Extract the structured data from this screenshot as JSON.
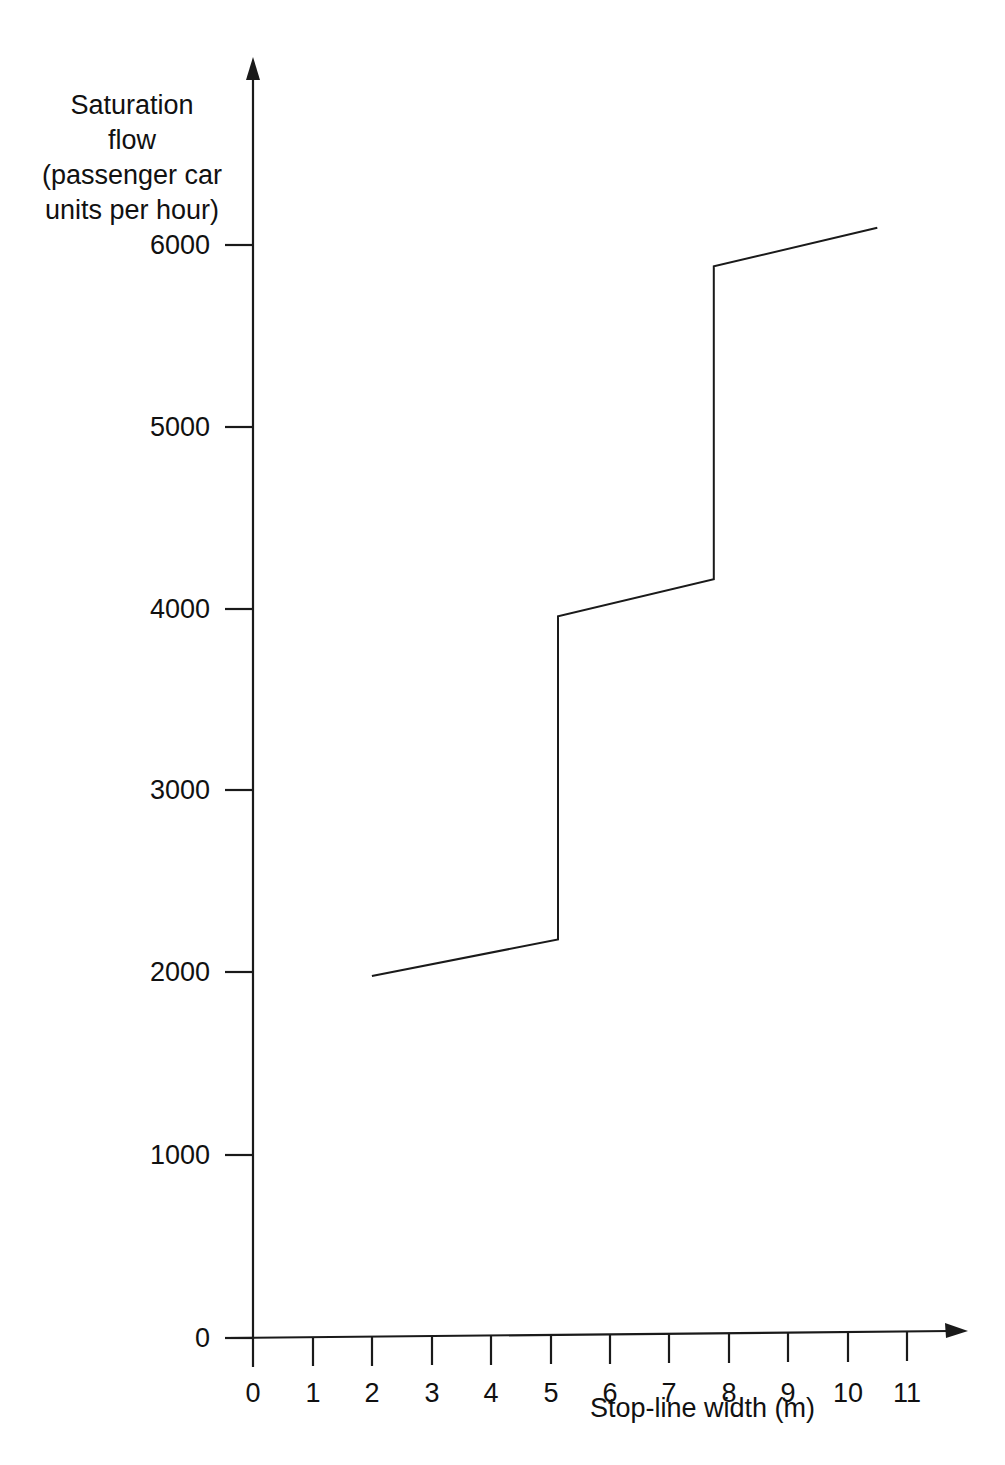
{
  "chart_data": {
    "type": "line",
    "title": "",
    "xlabel": "Stop-line width (m)",
    "ylabel": "Saturation flow\n(passenger car\nunits per hour)",
    "xlim": [
      0,
      11.8
    ],
    "ylim": [
      0,
      6400
    ],
    "xticks": [
      0,
      1,
      2,
      3,
      4,
      5,
      6,
      7,
      8,
      9,
      10,
      11
    ],
    "xtick_labels": [
      "0",
      "1",
      "2",
      "3",
      "4",
      "5",
      "6",
      "7",
      "8",
      "9",
      "10",
      "11"
    ],
    "yticks": [
      0,
      1000,
      2000,
      3000,
      4000,
      5000,
      6000
    ],
    "ytick_labels": [
      "0",
      "1000",
      "2000",
      "3000",
      "4000",
      "5000",
      "6000"
    ],
    "grid": false,
    "legend": null,
    "line_color": "#1a1a1a",
    "axis_color": "#1a1a1a",
    "series": [
      {
        "name": "Saturation flow",
        "step_like": true,
        "points": [
          {
            "x": 2.0,
            "y": 1980
          },
          {
            "x": 5.13,
            "y": 2170
          },
          {
            "x": 5.13,
            "y": 3945
          },
          {
            "x": 7.75,
            "y": 4140
          },
          {
            "x": 7.75,
            "y": 5857
          },
          {
            "x": 10.5,
            "y": 6060
          }
        ]
      }
    ],
    "annotations": []
  },
  "axes": {
    "y_title_line_1": "Saturation",
    "y_title_line_2": "flow",
    "y_title_line_3": "(passenger car",
    "y_title_line_4": "units per hour)",
    "x_title": "Stop-line width (m)"
  },
  "ytick_labels": {
    "t0": "0",
    "t1": "1000",
    "t2": "2000",
    "t3": "3000",
    "t4": "4000",
    "t5": "5000",
    "t6": "6000"
  },
  "xtick_labels": {
    "t0": "0",
    "t1": "1",
    "t2": "2",
    "t3": "3",
    "t4": "4",
    "t5": "5",
    "t6": "6",
    "t7": "7",
    "t8": "8",
    "t9": "9",
    "t10": "10",
    "t11": "11"
  }
}
